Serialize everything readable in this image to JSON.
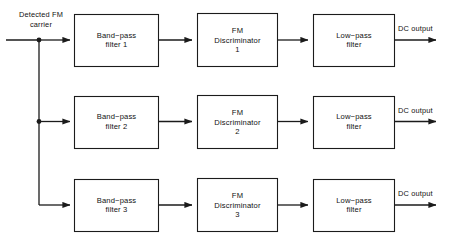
{
  "diagram": {
    "input": {
      "label_line1": "Detected  FM",
      "label_line2": "carrier"
    },
    "rows": [
      {
        "bandpass": {
          "line1": "Band−pass",
          "line2": "filter 1"
        },
        "discriminator": {
          "line1": "FM",
          "line2": "Discriminator",
          "line3": "1"
        },
        "lowpass": {
          "line1": "Low−pass",
          "line2": "filter"
        },
        "output_label": "DC output"
      },
      {
        "bandpass": {
          "line1": "Band−pass",
          "line2": "filter 2"
        },
        "discriminator": {
          "line1": "FM",
          "line2": "Discriminator",
          "line3": "2"
        },
        "lowpass": {
          "line1": "Low−pass",
          "line2": "filter"
        },
        "output_label": "DC output"
      },
      {
        "bandpass": {
          "line1": "Band−pass",
          "line2": "filter 3"
        },
        "discriminator": {
          "line1": "FM",
          "line2": "Discriminator",
          "line3": "3"
        },
        "lowpass": {
          "line1": "Low−pass",
          "line2": "filter"
        },
        "output_label": "DC output"
      }
    ],
    "colors": {
      "line": "#1b1b1b",
      "box_fill": "#ffffff",
      "text": "#111111",
      "background": "#ffffff"
    }
  }
}
